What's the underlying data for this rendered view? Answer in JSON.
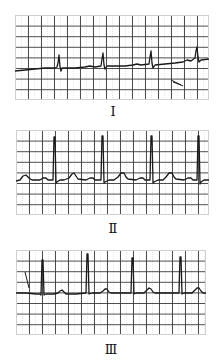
{
  "figure": {
    "colors": {
      "grid": "#3a3a3a",
      "grid_faint": "#cfcfcf",
      "trace": "#1a1a1a",
      "background": "#ffffff"
    },
    "panels": [
      {
        "label": "Ⅰ",
        "box": {
          "x": 15,
          "y": 15,
          "w": 194,
          "h": 85
        },
        "label_pos": {
          "x": 93,
          "y": 105
        },
        "trace": "M0,56 L10,55 L20,54 L30,53 L40,53 L42,52 L43,48 L44,40 L45,52 L46,56 L47,53 L60,53 L70,52 L75,51 L80,52 L86,51 L87,44 L88,38 L89,50 L90,54 L92,51 L110,51 L118,50 L122,49 L126,50 L134,49 L135,42 L136,36 L137,48 L138,53 L140,50 L150,49 L160,48 L168,47 L172,45 L176,46 L180,43 L181,36 L182,32 L183,42 L184,47 L186,45 L194,44",
        "marks": [
          "M156,65 L168,71",
          "M158,67 L166,70"
        ]
      },
      {
        "label": "Ⅱ",
        "box": {
          "x": 16,
          "y": 130,
          "w": 193,
          "h": 85
        },
        "label_pos": {
          "x": 93,
          "y": 222
        },
        "trace": "M0,51 L4,50 L7,46 L10,45 L13,48 L16,50 L24,50 L27,48 L30,48 L32,50 L37,50 L38,7 L39,7 L40,53 L41,52 L44,50 L48,50 L53,48 L56,44 L58,43 L60,46 L62,49 L70,50 L74,48 L77,48 L79,50 L85,50 L86,6 L87,6 L88,53 L89,52 L93,50 L98,50 L102,47 L105,43 L108,43 L110,47 L112,49 L120,50 L124,48 L127,48 L129,50 L134,50 L135,6 L136,6 L137,53 L138,52 L142,50 L147,50 L150,47 L153,43 L156,43 L158,47 L160,49 L168,50 L172,48 L175,48 L177,50 L181,50 L182,6 L183,6 L184,54 L185,52 L188,50 L193,50",
        "marks": []
      },
      {
        "label": "Ⅲ",
        "box": {
          "x": 16,
          "y": 250,
          "w": 190,
          "h": 85
        },
        "label_pos": {
          "x": 91,
          "y": 343
        },
        "trace": "M0,43 L10,43 L20,44 L24,44 L25,45 L26,10 L27,10 L28,45 L30,44 L38,44 L42,43 L44,41 L46,40 L48,42 L50,44 L60,44 L70,43 L71,4 L72,4 L73,44 L76,43 L84,43 L87,41 L89,39 L91,39 L93,42 L95,43 L105,43 L115,43 L116,8 L117,8 L118,44 L120,43 L128,43 L131,40 L133,38 L135,39 L137,42 L139,43 L150,43 L163,43 L164,7 L165,7 L166,44 L168,43 L176,43 L179,40 L181,38 L183,38 L185,41 L187,43 L190,43",
        "marks": [
          "M9,22 L13,38"
        ]
      }
    ],
    "grid": {
      "cell_w": 13,
      "cell_h": 10.6
    }
  }
}
